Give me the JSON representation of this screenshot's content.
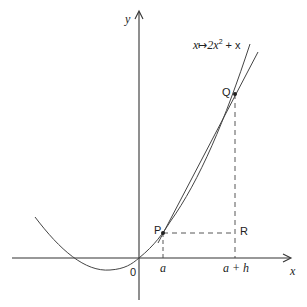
{
  "diagram": {
    "function_label": "x↦2x² + x",
    "function_parts": {
      "lhs": "x",
      "arrow": "↦",
      "coef": "2x",
      "exp": "2",
      "rest": " + x"
    },
    "axes": {
      "x_label": "x",
      "y_label": "y",
      "origin_label": "0"
    },
    "points": {
      "P": "P",
      "Q": "Q",
      "R": "R"
    },
    "ticks": {
      "a": "a",
      "a_plus_h": "a + h"
    },
    "colors": {
      "line": "#333333",
      "text": "#222222",
      "background": "#ffffff"
    }
  }
}
